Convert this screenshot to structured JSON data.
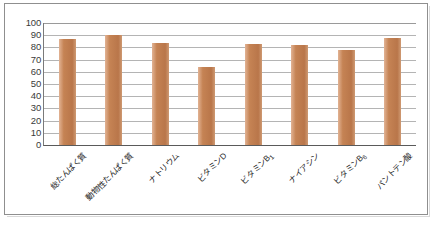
{
  "chart_data": {
    "type": "bar",
    "title": "",
    "subtitle": "",
    "xlabel": "",
    "ylabel": "",
    "categories": [
      "総たんぱく質",
      "動物性たんぱく質",
      "ナトリウム",
      "ビタミンD",
      "ビタミンB₁",
      "ナイアシン",
      "ビタミンB₆",
      "パントテン酸"
    ],
    "values": [
      87,
      90,
      84,
      64,
      83,
      82,
      78,
      88
    ],
    "ylim": [
      0,
      100
    ],
    "ytick_step": 10,
    "yticks": [
      100,
      90,
      80,
      70,
      60,
      50,
      40,
      30,
      20,
      10,
      0
    ],
    "grid": true,
    "legend": "none",
    "series": [
      {
        "name": "",
        "values": [
          87,
          90,
          84,
          64,
          83,
          82,
          78,
          88
        ]
      }
    ]
  },
  "style": {
    "bar_color": "#c58354",
    "bar_color_light": "#e2b394",
    "bar_color_dark": "#b9764a",
    "grid_color": "#b4b4b4",
    "axis_color": "#5a5a5a",
    "frame_color": "#8f8f8f",
    "text_color": "#1f1f1f",
    "background": "#ffffff"
  }
}
